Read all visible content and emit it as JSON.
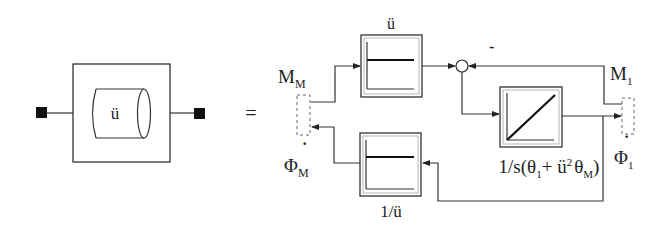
{
  "diagram": {
    "title": "",
    "equals_sign": "=",
    "colors": {
      "stroke": "#333333",
      "fill_port": "#111111",
      "background": "#ffffff",
      "dashed_port": "#666666"
    },
    "component": {
      "label": "ü",
      "shape": "cylinder-in-square",
      "terminals": [
        "left-flange",
        "right-flange"
      ]
    },
    "blocks": {
      "gain_top": {
        "label": "ü",
        "icon": "constant-gain-icon"
      },
      "integrator": {
        "formula_main": "1/s(θ",
        "sub1": "1",
        "plus": "+ ü",
        "sup2": "2",
        "theta": "θ",
        "subM": "M",
        "close": ")",
        "icon": "integrator-ramp-icon"
      },
      "gain_bottom": {
        "label": "1/ü",
        "icon": "constant-gain-icon"
      },
      "sum": {
        "sign": "-"
      }
    },
    "signals": {
      "m_m": {
        "main": "M",
        "sub": "M"
      },
      "phi_m": {
        "main": "Φ",
        "sub": "M",
        "dot": "·"
      },
      "m_1": {
        "main": "M",
        "sub": "1"
      },
      "phi_1": {
        "main": "Φ",
        "sub": "1",
        "dot": "·"
      }
    }
  }
}
